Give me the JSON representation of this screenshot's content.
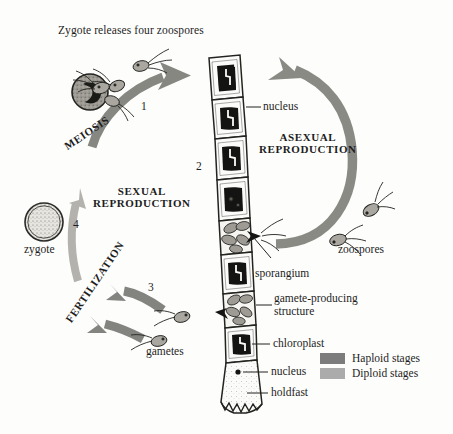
{
  "diagram": {
    "title": "Zygote releases four zoospores",
    "organism_structure": "filamentous green alga",
    "cycle_labels": {
      "meiosis": "MEIOSIS",
      "fertilization": "FERTILIZATION",
      "sexual": "SEXUAL\nREPRODUCTION",
      "asexual": "ASEXUAL\nREPRODUCTION"
    },
    "step_numbers": {
      "one": "1",
      "two": "2",
      "three": "3",
      "four": "4"
    },
    "part_labels": {
      "nucleus_top": "nucleus",
      "zoospores": "zoospores",
      "sporangium": "sporangium",
      "gamete_structure": "gamete-producing\nstructure",
      "chloroplast": "chloroplast",
      "nucleus_bottom": "nucleus",
      "holdfast": "holdfast",
      "gametes": "gametes",
      "zygote": "zygote"
    },
    "legend": {
      "items": [
        {
          "label": "Haploid stages",
          "color": "#7c7c7c"
        },
        {
          "label": "Diploid stages",
          "color": "#ababab"
        }
      ]
    },
    "colors": {
      "haploid_gray": "#7c7c7c",
      "diploid_gray": "#ababab",
      "ink": "#1d1d1d",
      "chloroplast_dark": "#151515",
      "cell_fill": "#fbfbfa",
      "background": "#fdfdfc"
    }
  }
}
